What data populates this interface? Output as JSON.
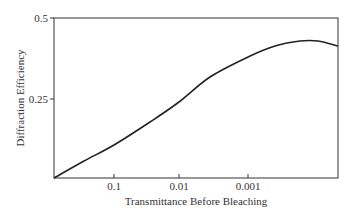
{
  "chart_data": {
    "type": "line",
    "title": "",
    "xlabel": "Transmittance Before Bleaching",
    "ylabel": "Diffraction Efficiency",
    "x_scale": "log (decreasing)",
    "x_tick_labels": [
      "0.1",
      "0.01",
      "0.001"
    ],
    "y_tick_labels": [
      "0.25",
      "0.5"
    ],
    "ylim": [
      0,
      0.5
    ],
    "grid": false,
    "legend": null,
    "series": [
      {
        "name": "Diffraction Efficiency",
        "x": [
          1.0,
          0.1,
          0.03,
          0.01,
          0.003,
          0.001,
          0.0003,
          0.0001,
          3e-05
        ],
        "y": [
          0.0,
          0.1,
          0.175,
          0.237,
          0.316,
          0.378,
          0.425,
          0.428,
          0.412
        ]
      }
    ]
  },
  "plot": {
    "pixel_points": [
      [
        54,
        178
      ],
      [
        84,
        161
      ],
      [
        114,
        145
      ],
      [
        150,
        122
      ],
      [
        179,
        102
      ],
      [
        210,
        77
      ],
      [
        248,
        57
      ],
      [
        275,
        46
      ],
      [
        300,
        41
      ],
      [
        318,
        41
      ],
      [
        338,
        46
      ]
    ]
  }
}
